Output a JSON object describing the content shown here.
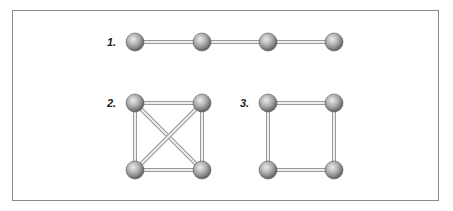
{
  "figure": {
    "graphs": [
      {
        "label": "1.",
        "name": "path-graph",
        "nodes": [
          [
            135,
            42
          ],
          [
            202,
            42
          ],
          [
            268,
            42
          ],
          [
            334,
            42
          ]
        ],
        "edges": [
          [
            0,
            1
          ],
          [
            1,
            2
          ],
          [
            2,
            3
          ]
        ],
        "label_pos": [
          107,
          46
        ]
      },
      {
        "label": "2.",
        "name": "complete-graph-k4",
        "nodes": [
          [
            135,
            103
          ],
          [
            202,
            103
          ],
          [
            135,
            170
          ],
          [
            202,
            170
          ]
        ],
        "edges": [
          [
            0,
            1
          ],
          [
            0,
            2
          ],
          [
            1,
            3
          ],
          [
            2,
            3
          ],
          [
            0,
            3
          ],
          [
            1,
            2
          ]
        ],
        "label_pos": [
          107,
          107
        ]
      },
      {
        "label": "3.",
        "name": "cycle-graph-c4",
        "nodes": [
          [
            268,
            103
          ],
          [
            334,
            103
          ],
          [
            268,
            170
          ],
          [
            334,
            170
          ]
        ],
        "edges": [
          [
            0,
            1
          ],
          [
            0,
            2
          ],
          [
            1,
            3
          ],
          [
            2,
            3
          ]
        ],
        "label_pos": [
          240,
          107
        ]
      }
    ],
    "style": {
      "node_radius": 9,
      "edge_color": "#c8c8c8",
      "edge_outline": "#9a9a9a",
      "node_light": "#e6e6e6",
      "node_dark": "#6e6e6e",
      "border_color": "#8a8a8a"
    }
  }
}
